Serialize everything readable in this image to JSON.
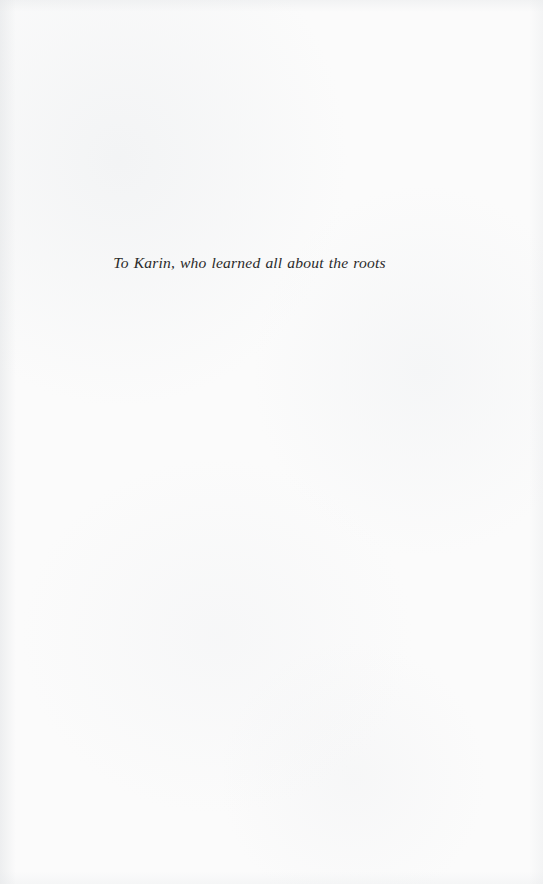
{
  "page": {
    "kind": "book-dedication-page",
    "width": 543,
    "height": 884,
    "background_color": "#fbfbfb",
    "ink_color": "#2a2a2a"
  },
  "dedication": {
    "text": "To Karin, who learned all about the roots"
  }
}
